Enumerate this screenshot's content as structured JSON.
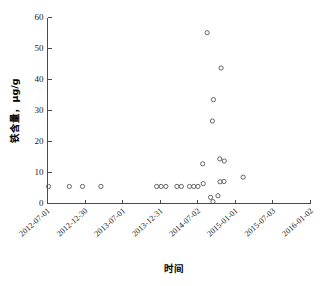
{
  "chart_data": {
    "type": "scatter",
    "title": "",
    "xlabel": "时间",
    "ylabel": "铁含量，μg/g",
    "ylim": [
      0,
      60
    ],
    "yticks": [
      0,
      10,
      20,
      30,
      40,
      50,
      60
    ],
    "ytick_labels": [
      "0",
      "10",
      "20",
      "30",
      "40",
      "50",
      "60"
    ],
    "xtick_labels": [
      "2012-07-01",
      "2012-12-30",
      "2013-07-01",
      "2013-12-31",
      "2014-07-02",
      "2015-01-01",
      "2015-07-03",
      "2016-01-02"
    ],
    "xtick_fractions": [
      0.0,
      0.143,
      0.286,
      0.429,
      0.571,
      0.714,
      0.857,
      1.0
    ],
    "grid": false,
    "legend": null,
    "marker": "open-circle",
    "marker_color": "#555555",
    "series": [
      {
        "name": "铁含量",
        "points": [
          {
            "xf": 0.004,
            "y": 5.5
          },
          {
            "xf": 0.083,
            "y": 5.5
          },
          {
            "xf": 0.133,
            "y": 5.5
          },
          {
            "xf": 0.203,
            "y": 5.5
          },
          {
            "xf": 0.415,
            "y": 5.5
          },
          {
            "xf": 0.432,
            "y": 5.5
          },
          {
            "xf": 0.45,
            "y": 5.5
          },
          {
            "xf": 0.492,
            "y": 5.5
          },
          {
            "xf": 0.509,
            "y": 5.5
          },
          {
            "xf": 0.54,
            "y": 5.5
          },
          {
            "xf": 0.556,
            "y": 5.5
          },
          {
            "xf": 0.572,
            "y": 5.5
          },
          {
            "xf": 0.592,
            "y": 6.4
          },
          {
            "xf": 0.59,
            "y": 12.8
          },
          {
            "xf": 0.607,
            "y": 55.1
          },
          {
            "xf": 0.62,
            "y": 2.0
          },
          {
            "xf": 0.629,
            "y": 0.6
          },
          {
            "xf": 0.627,
            "y": 26.6
          },
          {
            "xf": 0.631,
            "y": 33.5
          },
          {
            "xf": 0.648,
            "y": 2.5
          },
          {
            "xf": 0.66,
            "y": 43.7
          },
          {
            "xf": 0.655,
            "y": 14.4
          },
          {
            "xf": 0.672,
            "y": 13.7
          },
          {
            "xf": 0.656,
            "y": 7.0
          },
          {
            "xf": 0.671,
            "y": 7.1
          },
          {
            "xf": 0.744,
            "y": 8.5
          }
        ]
      }
    ]
  }
}
